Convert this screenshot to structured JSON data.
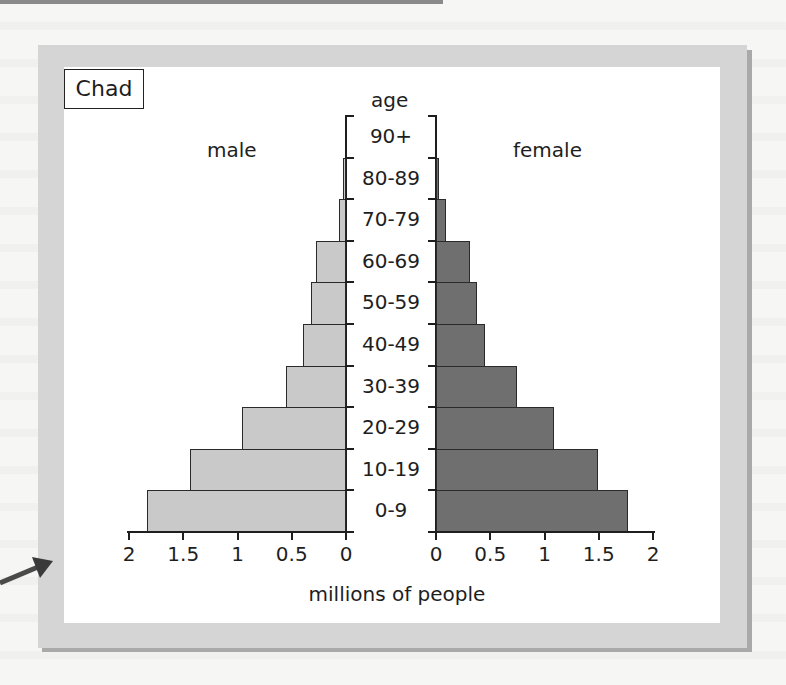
{
  "chart_data": {
    "type": "bar",
    "orientation": "horizontal",
    "subtype": "population-pyramid",
    "title": "Chad",
    "categories": [
      "0-9",
      "10-19",
      "20-29",
      "30-39",
      "40-49",
      "50-59",
      "60-69",
      "70-79",
      "80-89",
      "90+"
    ],
    "series": [
      {
        "name": "male",
        "color": "#c9c9c9",
        "values": [
          1.83,
          1.44,
          0.96,
          0.55,
          0.4,
          0.32,
          0.28,
          0.06,
          0.01,
          0.0
        ]
      },
      {
        "name": "female",
        "color": "#6f6f6f",
        "values": [
          1.77,
          1.49,
          1.09,
          0.75,
          0.45,
          0.38,
          0.31,
          0.09,
          0.02,
          0.0
        ]
      }
    ],
    "xlabel": "millions of people",
    "ylabel": "age",
    "xlim": [
      0,
      2
    ],
    "x_ticks_male": [
      "2",
      "1.5",
      "1",
      "0.5",
      "0"
    ],
    "x_ticks_female": [
      "0",
      "0.5",
      "1",
      "1.5",
      "2"
    ],
    "x_tick_values": [
      0,
      0.5,
      1,
      1.5,
      2
    ],
    "grid": false,
    "legend": "side labels (male left, female right)"
  },
  "labels": {
    "country": "Chad",
    "age_title": "age",
    "male": "male",
    "female": "female",
    "xlabel": "millions of people"
  },
  "colors": {
    "male_bar": "#c9c9c9",
    "female_bar": "#6f6f6f",
    "frame": "#d5d5d5",
    "frame_shadow": "#a9a9a9",
    "arrow": "#4a4a4a"
  }
}
